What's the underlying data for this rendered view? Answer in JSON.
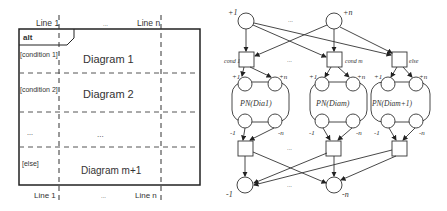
{
  "left_diagram": {
    "operator": "alt",
    "lifelines_top": [
      "Line 1",
      "...",
      "Line n"
    ],
    "lifelines_bottom": [
      "Line 1",
      "...",
      "Line n"
    ],
    "guards": [
      "[condition 1]",
      "[condition 2]",
      "...",
      "[else]"
    ],
    "operands": [
      "Diagram 1",
      "Diagram 2",
      "...",
      "Diagram m+1"
    ]
  },
  "right_diagram": {
    "top_places": [
      "+1",
      "+n"
    ],
    "top_ellipsis": "...",
    "transitions": [
      "cond 1",
      "cond m",
      "else"
    ],
    "subnets": [
      "PN(Dia1)",
      "PN(Diam)",
      "PN(Diam+1)"
    ],
    "subnet_in": [
      "+1",
      "+n"
    ],
    "subnet_out": [
      "-1",
      "-n"
    ],
    "bottom_places": [
      "-1",
      "-n"
    ],
    "ellipsis": "..."
  }
}
